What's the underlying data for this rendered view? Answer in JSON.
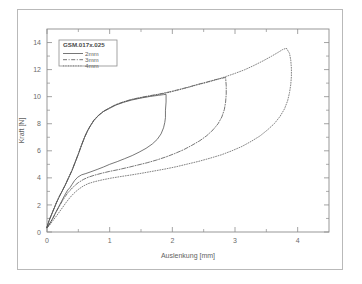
{
  "figure": {
    "border_color": "#b9b9b9",
    "background": "#ffffff"
  },
  "chart_data": {
    "type": "line",
    "title": "",
    "xlabel": "Auslenkung [mm]",
    "ylabel": "Kraft [N]",
    "xlim": [
      0,
      4.5
    ],
    "ylim": [
      0,
      15
    ],
    "xticks": [
      0,
      1,
      2,
      3,
      4
    ],
    "xtick_labels": [
      "0",
      "1",
      "2",
      "3",
      "4"
    ],
    "xminor_ticks": [
      0.5,
      1.5,
      2.5,
      3.5
    ],
    "yticks": [
      0,
      2,
      4,
      6,
      8,
      10,
      12,
      14
    ],
    "ytick_labels": [
      "0",
      "2",
      "4",
      "6",
      "8",
      "10",
      "12",
      "14"
    ],
    "yminor_ticks": [
      1,
      3,
      5,
      7,
      9,
      11,
      13
    ],
    "grid": false,
    "legend_position": "upper left",
    "legend_title": "GSM.017x.025",
    "axis_color": "#8d8d8d",
    "curve_color": "#4a4a4a",
    "series": [
      {
        "name": "2mm",
        "style": "solid",
        "color": "#4a4a4a",
        "loading": [
          [
            0.0,
            0.35
          ],
          [
            0.03,
            0.8
          ],
          [
            0.07,
            1.25
          ],
          [
            0.11,
            1.7
          ],
          [
            0.15,
            2.15
          ],
          [
            0.19,
            2.55
          ],
          [
            0.24,
            3.0
          ],
          [
            0.29,
            3.45
          ],
          [
            0.34,
            3.95
          ],
          [
            0.4,
            4.55
          ],
          [
            0.45,
            5.15
          ],
          [
            0.5,
            5.75
          ],
          [
            0.55,
            6.4
          ],
          [
            0.6,
            7.0
          ],
          [
            0.65,
            7.5
          ],
          [
            0.7,
            7.9
          ],
          [
            0.75,
            8.25
          ],
          [
            0.82,
            8.6
          ],
          [
            0.9,
            8.9
          ],
          [
            1.0,
            9.15
          ],
          [
            1.1,
            9.38
          ],
          [
            1.22,
            9.58
          ],
          [
            1.35,
            9.75
          ],
          [
            1.5,
            9.9
          ],
          [
            1.65,
            10.02
          ],
          [
            1.78,
            10.1
          ],
          [
            1.86,
            10.15
          ],
          [
            1.9,
            10.17
          ]
        ],
        "unloading": [
          [
            1.9,
            10.17
          ],
          [
            1.9,
            9.6
          ],
          [
            1.89,
            9.0
          ],
          [
            1.89,
            8.45
          ],
          [
            1.88,
            8.1
          ],
          [
            1.86,
            7.7
          ],
          [
            1.82,
            7.25
          ],
          [
            1.76,
            6.85
          ],
          [
            1.68,
            6.5
          ],
          [
            1.58,
            6.18
          ],
          [
            1.47,
            5.9
          ],
          [
            1.36,
            5.65
          ],
          [
            1.24,
            5.42
          ],
          [
            1.12,
            5.2
          ],
          [
            1.0,
            5.0
          ],
          [
            0.9,
            4.8
          ],
          [
            0.8,
            4.62
          ],
          [
            0.7,
            4.45
          ],
          [
            0.62,
            4.32
          ],
          [
            0.55,
            4.22
          ],
          [
            0.49,
            4.05
          ],
          [
            0.44,
            3.8
          ],
          [
            0.4,
            3.52
          ],
          [
            0.37,
            3.3
          ],
          [
            0.33,
            3.1
          ],
          [
            0.28,
            2.7
          ],
          [
            0.23,
            2.25
          ],
          [
            0.18,
            1.8
          ],
          [
            0.13,
            1.35
          ],
          [
            0.09,
            0.98
          ],
          [
            0.05,
            0.68
          ],
          [
            0.02,
            0.45
          ],
          [
            0.0,
            0.32
          ]
        ]
      },
      {
        "name": "3mm",
        "style": "dashdot",
        "color": "#4a4a4a",
        "loading": [
          [
            0.0,
            0.35
          ],
          [
            0.03,
            0.82
          ],
          [
            0.07,
            1.28
          ],
          [
            0.11,
            1.72
          ],
          [
            0.15,
            2.18
          ],
          [
            0.19,
            2.58
          ],
          [
            0.24,
            3.02
          ],
          [
            0.29,
            3.48
          ],
          [
            0.34,
            3.98
          ],
          [
            0.4,
            4.58
          ],
          [
            0.45,
            5.18
          ],
          [
            0.5,
            5.78
          ],
          [
            0.55,
            6.42
          ],
          [
            0.6,
            7.02
          ],
          [
            0.65,
            7.52
          ],
          [
            0.7,
            7.92
          ],
          [
            0.75,
            8.28
          ],
          [
            0.82,
            8.62
          ],
          [
            0.9,
            8.92
          ],
          [
            1.0,
            9.18
          ],
          [
            1.1,
            9.42
          ],
          [
            1.22,
            9.62
          ],
          [
            1.35,
            9.8
          ],
          [
            1.5,
            9.95
          ],
          [
            1.65,
            10.08
          ],
          [
            1.8,
            10.2
          ],
          [
            1.95,
            10.35
          ],
          [
            2.1,
            10.52
          ],
          [
            2.25,
            10.7
          ],
          [
            2.4,
            10.9
          ],
          [
            2.55,
            11.08
          ],
          [
            2.68,
            11.25
          ],
          [
            2.78,
            11.35
          ],
          [
            2.85,
            11.42
          ]
        ],
        "unloading": [
          [
            2.85,
            11.42
          ],
          [
            2.86,
            10.8
          ],
          [
            2.86,
            10.2
          ],
          [
            2.85,
            9.6
          ],
          [
            2.83,
            9.05
          ],
          [
            2.79,
            8.5
          ],
          [
            2.73,
            8.0
          ],
          [
            2.65,
            7.55
          ],
          [
            2.55,
            7.12
          ],
          [
            2.44,
            6.75
          ],
          [
            2.31,
            6.4
          ],
          [
            2.18,
            6.08
          ],
          [
            2.04,
            5.8
          ],
          [
            1.9,
            5.55
          ],
          [
            1.75,
            5.32
          ],
          [
            1.6,
            5.12
          ],
          [
            1.45,
            4.95
          ],
          [
            1.3,
            4.78
          ],
          [
            1.15,
            4.62
          ],
          [
            1.0,
            4.48
          ],
          [
            0.88,
            4.35
          ],
          [
            0.76,
            4.2
          ],
          [
            0.66,
            4.05
          ],
          [
            0.58,
            3.88
          ],
          [
            0.5,
            3.65
          ],
          [
            0.44,
            3.42
          ],
          [
            0.39,
            3.18
          ],
          [
            0.34,
            2.95
          ],
          [
            0.29,
            2.62
          ],
          [
            0.24,
            2.25
          ],
          [
            0.19,
            1.85
          ],
          [
            0.14,
            1.45
          ],
          [
            0.1,
            1.08
          ],
          [
            0.06,
            0.75
          ],
          [
            0.03,
            0.5
          ],
          [
            0.0,
            0.32
          ]
        ]
      },
      {
        "name": "4mm",
        "style": "dotted",
        "color": "#5a5a5a",
        "loading": [
          [
            0.0,
            0.35
          ],
          [
            0.03,
            0.8
          ],
          [
            0.07,
            1.25
          ],
          [
            0.11,
            1.7
          ],
          [
            0.15,
            2.15
          ],
          [
            0.19,
            2.55
          ],
          [
            0.24,
            3.0
          ],
          [
            0.29,
            3.45
          ],
          [
            0.34,
            3.95
          ],
          [
            0.4,
            4.55
          ],
          [
            0.45,
            5.15
          ],
          [
            0.5,
            5.75
          ],
          [
            0.55,
            6.4
          ],
          [
            0.6,
            7.0
          ],
          [
            0.65,
            7.5
          ],
          [
            0.7,
            7.9
          ],
          [
            0.75,
            8.25
          ],
          [
            0.82,
            8.6
          ],
          [
            0.9,
            8.9
          ],
          [
            1.0,
            9.15
          ],
          [
            1.1,
            9.4
          ],
          [
            1.22,
            9.6
          ],
          [
            1.35,
            9.78
          ],
          [
            1.5,
            9.92
          ],
          [
            1.65,
            10.05
          ],
          [
            1.8,
            10.18
          ],
          [
            1.95,
            10.32
          ],
          [
            2.1,
            10.5
          ],
          [
            2.25,
            10.68
          ],
          [
            2.4,
            10.88
          ],
          [
            2.55,
            11.05
          ],
          [
            2.7,
            11.25
          ],
          [
            2.85,
            11.48
          ],
          [
            3.0,
            11.72
          ],
          [
            3.15,
            11.98
          ],
          [
            3.3,
            12.3
          ],
          [
            3.45,
            12.65
          ],
          [
            3.58,
            12.98
          ],
          [
            3.68,
            13.25
          ],
          [
            3.76,
            13.48
          ],
          [
            3.82,
            13.58
          ]
        ],
        "unloading": [
          [
            3.82,
            13.58
          ],
          [
            3.87,
            13.2
          ],
          [
            3.89,
            12.7
          ],
          [
            3.9,
            12.1
          ],
          [
            3.9,
            11.5
          ],
          [
            3.89,
            10.9
          ],
          [
            3.87,
            10.3
          ],
          [
            3.84,
            9.7
          ],
          [
            3.79,
            9.1
          ],
          [
            3.72,
            8.55
          ],
          [
            3.63,
            8.02
          ],
          [
            3.52,
            7.55
          ],
          [
            3.4,
            7.1
          ],
          [
            3.26,
            6.7
          ],
          [
            3.11,
            6.32
          ],
          [
            2.95,
            6.0
          ],
          [
            2.78,
            5.7
          ],
          [
            2.6,
            5.45
          ],
          [
            2.42,
            5.22
          ],
          [
            2.24,
            5.02
          ],
          [
            2.06,
            4.82
          ],
          [
            1.88,
            4.65
          ],
          [
            1.7,
            4.5
          ],
          [
            1.52,
            4.35
          ],
          [
            1.35,
            4.22
          ],
          [
            1.18,
            4.1
          ],
          [
            1.02,
            3.98
          ],
          [
            0.88,
            3.85
          ],
          [
            0.76,
            3.72
          ],
          [
            0.66,
            3.58
          ],
          [
            0.58,
            3.4
          ],
          [
            0.51,
            3.18
          ],
          [
            0.45,
            2.95
          ],
          [
            0.4,
            2.72
          ],
          [
            0.35,
            2.45
          ],
          [
            0.3,
            2.15
          ],
          [
            0.25,
            1.82
          ],
          [
            0.2,
            1.5
          ],
          [
            0.15,
            1.18
          ],
          [
            0.1,
            0.88
          ],
          [
            0.06,
            0.62
          ],
          [
            0.03,
            0.45
          ],
          [
            0.0,
            0.3
          ]
        ]
      }
    ]
  }
}
